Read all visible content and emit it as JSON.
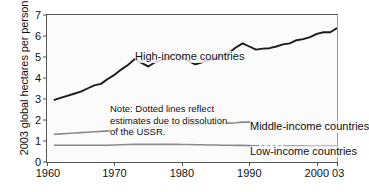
{
  "chart_data": {
    "type": "line",
    "title": "",
    "xlabel": "",
    "ylabel": "2003 global hectares per person",
    "xlim": [
      1960,
      2003
    ],
    "ylim": [
      0,
      7
    ],
    "grid": false,
    "legend_position": "inline-labels",
    "xticks": [
      "1960",
      "1970",
      "1980",
      "1990",
      "2000",
      "03"
    ],
    "xtick_values": [
      1960,
      1970,
      1980,
      1990,
      2000,
      2003
    ],
    "yticks": [
      "0",
      "1",
      "2",
      "3",
      "4",
      "5",
      "6",
      "7"
    ],
    "ytick_values": [
      0,
      1,
      2,
      3,
      4,
      5,
      6,
      7
    ],
    "annotations": [
      "Note: Dotted lines reflect estimates due to dissolution of the USSR."
    ],
    "x": [
      1961,
      1962,
      1963,
      1964,
      1965,
      1966,
      1967,
      1968,
      1969,
      1970,
      1971,
      1972,
      1973,
      1974,
      1975,
      1976,
      1977,
      1978,
      1979,
      1980,
      1981,
      1982,
      1983,
      1984,
      1985,
      1986,
      1987,
      1988,
      1989,
      1990,
      1991,
      1992,
      1993,
      1994,
      1995,
      1996,
      1997,
      1998,
      1999,
      2000,
      2001,
      2002,
      2003
    ],
    "series": [
      {
        "name": "High-income countries",
        "color": "#1a1a1a",
        "width": 1.9,
        "dotted_from": null,
        "dotted_to": null,
        "values": [
          2.95,
          3.05,
          3.15,
          3.25,
          3.35,
          3.5,
          3.65,
          3.72,
          3.95,
          4.15,
          4.4,
          4.62,
          4.9,
          4.72,
          4.55,
          4.75,
          4.85,
          4.95,
          5.15,
          5.0,
          4.8,
          4.65,
          4.75,
          4.85,
          4.95,
          5.05,
          5.2,
          5.45,
          5.65,
          5.5,
          5.35,
          5.4,
          5.42,
          5.5,
          5.6,
          5.65,
          5.8,
          5.85,
          5.95,
          6.1,
          6.18,
          6.18,
          6.38
        ]
      },
      {
        "name": "Middle-income countries",
        "color": "#8a8a8a",
        "width": 1.6,
        "dotted_from": 1991,
        "dotted_to": 1995,
        "values": [
          1.32,
          1.34,
          1.36,
          1.38,
          1.4,
          1.42,
          1.44,
          1.46,
          1.48,
          1.52,
          1.55,
          1.52,
          1.58,
          1.62,
          1.63,
          1.66,
          1.7,
          1.72,
          1.74,
          1.77,
          1.78,
          1.77,
          1.78,
          1.79,
          1.8,
          1.83,
          1.85,
          1.87,
          1.9,
          1.9,
          1.86,
          1.8,
          1.78,
          1.78,
          1.79,
          1.78,
          1.79,
          1.77,
          1.76,
          1.77,
          1.78,
          1.79,
          1.8
        ]
      },
      {
        "name": "Low-income countries",
        "color": "#8a8a8a",
        "width": 1.6,
        "dotted_from": 1991,
        "dotted_to": 1995,
        "values": [
          0.8,
          0.8,
          0.8,
          0.8,
          0.8,
          0.8,
          0.8,
          0.8,
          0.8,
          0.81,
          0.82,
          0.83,
          0.84,
          0.84,
          0.84,
          0.84,
          0.84,
          0.84,
          0.84,
          0.83,
          0.83,
          0.82,
          0.82,
          0.81,
          0.81,
          0.8,
          0.8,
          0.79,
          0.79,
          0.78,
          0.77,
          0.76,
          0.76,
          0.76,
          0.76,
          0.76,
          0.76,
          0.76,
          0.75,
          0.75,
          0.75,
          0.75,
          0.75
        ]
      }
    ]
  },
  "labels": {
    "ylabel": "2003 global hectares per person",
    "high": "High-income countries",
    "middle": "Middle-income countries",
    "low": "Low-income countries",
    "note_line1": "Note: Dotted lines reflect",
    "note_line2": "estimates due to dissolution",
    "note_line3": "of the USSR."
  }
}
